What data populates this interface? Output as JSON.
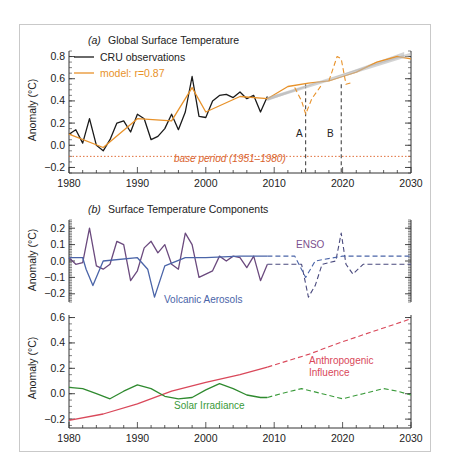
{
  "chart_data": [
    {
      "panel": "a",
      "type": "line",
      "title_prefix": "(a)",
      "title": "Global Surface Temperature",
      "xlabel": "",
      "ylabel": "Anomaly (°C)",
      "xlim": [
        1980,
        2030
      ],
      "ylim": [
        -0.25,
        0.85
      ],
      "xticks": [
        "1980",
        "1990",
        "2000",
        "2010",
        "2020",
        "2030"
      ],
      "yticks": [
        "−0.2",
        "0.0",
        "0.2",
        "0.4",
        "0.6",
        "0.8"
      ],
      "legend": [
        {
          "label": "CRU observations",
          "color": "#1a1a1a"
        },
        {
          "label": "model: r=0.87",
          "color": "#e8922a"
        }
      ],
      "annotations": [
        {
          "text": "A",
          "x": 2014.6
        },
        {
          "text": "B",
          "x": 2019.8
        },
        {
          "text": "base period (1951–1980)",
          "y": -0.1,
          "color": "#d9622b"
        }
      ],
      "series": [
        {
          "name": "CRU observations",
          "color": "#1a1a1a",
          "x": [
            1980,
            1981,
            1982,
            1983,
            1984,
            1985,
            1986,
            1987,
            1988,
            1989,
            1990,
            1991,
            1992,
            1993,
            1994,
            1995,
            1996,
            1997,
            1998,
            1999,
            2000,
            2001,
            2002,
            2003,
            2004,
            2005,
            2006,
            2007,
            2008,
            2009
          ],
          "y": [
            0.1,
            0.14,
            0.02,
            0.24,
            0.0,
            -0.05,
            0.05,
            0.2,
            0.22,
            0.12,
            0.28,
            0.24,
            0.05,
            0.08,
            0.15,
            0.28,
            0.14,
            0.3,
            0.62,
            0.26,
            0.25,
            0.4,
            0.45,
            0.46,
            0.43,
            0.48,
            0.42,
            0.45,
            0.3,
            0.44
          ]
        },
        {
          "name": "model: r=0.87",
          "color": "#e8922a",
          "x": [
            1980,
            1985,
            1990,
            1995,
            1998,
            2000,
            2005,
            2009,
            2012,
            2015,
            2018,
            2020,
            2022,
            2025,
            2028,
            2030
          ],
          "y": [
            0.1,
            -0.02,
            0.24,
            0.22,
            0.52,
            0.3,
            0.44,
            0.42,
            0.53,
            0.56,
            0.58,
            0.62,
            0.66,
            0.75,
            0.8,
            0.78
          ]
        },
        {
          "name": "model projection (shaded trend)",
          "color": "#b8b8b8",
          "x": [
            2009,
            2030
          ],
          "y": [
            0.42,
            0.82
          ]
        },
        {
          "name": "scenario A",
          "style": "dashed",
          "color": "#e8922a",
          "x": [
            2013,
            2014,
            2014.6,
            2015.5,
            2017
          ],
          "y": [
            0.52,
            0.4,
            0.28,
            0.42,
            0.55
          ]
        },
        {
          "name": "scenario B",
          "style": "dashed",
          "color": "#e8922a",
          "x": [
            2018,
            2019.2,
            2019.8,
            2020.5,
            2021.5
          ],
          "y": [
            0.58,
            0.8,
            0.78,
            0.55,
            0.57
          ]
        }
      ]
    },
    {
      "panel": "b-upper",
      "type": "line",
      "title_prefix": "(b)",
      "title": "Surface Temperature Components",
      "ylabel": "Anomaly (°C)",
      "xlim": [
        1980,
        2030
      ],
      "ylim": [
        -0.25,
        0.25
      ],
      "yticks": [
        "−0.2",
        "−0.1",
        "0.0",
        "0.1",
        "0.2"
      ],
      "labels": [
        {
          "text": "ENSO",
          "color": "#7b4f8e"
        },
        {
          "text": "Volcanic Aerosols",
          "color": "#4a64a8"
        }
      ],
      "series": [
        {
          "name": "ENSO",
          "color": "#6b4a7e",
          "x": [
            1980,
            1981,
            1982,
            1983,
            1984,
            1985,
            1986,
            1987,
            1988,
            1989,
            1990,
            1991,
            1992,
            1993,
            1994,
            1995,
            1996,
            1997,
            1998,
            1999,
            2000,
            2001,
            2002,
            2003,
            2004,
            2005,
            2006,
            2007,
            2008,
            2009
          ],
          "y": [
            0.02,
            -0.02,
            -0.01,
            0.2,
            -0.03,
            -0.05,
            -0.02,
            0.12,
            0.1,
            -0.12,
            -0.06,
            0.08,
            0.12,
            0.05,
            0.1,
            -0.02,
            -0.05,
            0.17,
            0.1,
            -0.1,
            -0.08,
            -0.06,
            0.03,
            0.0,
            0.03,
            0.02,
            -0.04,
            0.03,
            -0.12,
            -0.02
          ]
        },
        {
          "name": "ENSO (projection)",
          "color": "#4a4a7e",
          "style": "dashed",
          "x": [
            2009,
            2014,
            2015,
            2016,
            2017,
            2019,
            2019.8,
            2020.5,
            2021.5,
            2023,
            2030
          ],
          "y": [
            -0.02,
            -0.02,
            -0.22,
            -0.15,
            -0.02,
            0.0,
            0.17,
            -0.02,
            -0.08,
            -0.02,
            -0.02
          ]
        },
        {
          "name": "Volcanic Aerosols",
          "color": "#4a64a8",
          "x": [
            1980,
            1982,
            1982.5,
            1983.5,
            1985,
            1990,
            1991.5,
            1992.5,
            1994,
            1997,
            2000,
            2005,
            2009
          ],
          "y": [
            0.02,
            0.02,
            -0.05,
            -0.15,
            0.0,
            0.02,
            -0.05,
            -0.22,
            -0.03,
            0.02,
            0.02,
            0.03,
            0.03
          ]
        },
        {
          "name": "Volcanic Aerosols (projection)",
          "color": "#4a64a8",
          "style": "dashed",
          "x": [
            2009,
            2013,
            2014.6,
            2016,
            2020,
            2030
          ],
          "y": [
            0.03,
            0.03,
            -0.1,
            0.0,
            0.03,
            0.03
          ]
        }
      ]
    },
    {
      "panel": "b-lower",
      "type": "line",
      "ylabel": "Anomaly (°C)",
      "xlim": [
        1980,
        2030
      ],
      "ylim": [
        -0.25,
        0.62
      ],
      "xticks": [
        "1980",
        "1990",
        "2000",
        "2010",
        "2020",
        "2030"
      ],
      "yticks": [
        "−0.2",
        "0.0",
        "0.2",
        "0.4",
        "0.6"
      ],
      "labels": [
        {
          "text": "Anthropogenic",
          "color": "#d9485a"
        },
        {
          "text": "Influence",
          "color": "#d9485a"
        },
        {
          "text": "Solar Irradiance",
          "color": "#3a9a3a"
        }
      ],
      "series": [
        {
          "name": "Anthropogenic Influence",
          "color": "#d9485a",
          "x": [
            1980,
            1985,
            1990,
            1995,
            2000,
            2005,
            2009
          ],
          "y": [
            -0.21,
            -0.16,
            -0.08,
            0.02,
            0.09,
            0.15,
            0.21
          ]
        },
        {
          "name": "Anthropogenic Influence (projection)",
          "color": "#d9485a",
          "style": "dashed",
          "x": [
            2009,
            2015,
            2020,
            2025,
            2030
          ],
          "y": [
            0.21,
            0.31,
            0.41,
            0.5,
            0.59
          ]
        },
        {
          "name": "Solar Irradiance",
          "color": "#2f8a2f",
          "x": [
            1980,
            1982,
            1984,
            1986,
            1988,
            1990,
            1992,
            1994,
            1996,
            1998,
            2000,
            2002,
            2004,
            2006,
            2008,
            2009
          ],
          "y": [
            0.05,
            0.04,
            0.0,
            -0.04,
            0.02,
            0.07,
            0.04,
            -0.02,
            -0.04,
            -0.03,
            0.03,
            0.08,
            0.04,
            -0.01,
            -0.03,
            -0.03
          ]
        },
        {
          "name": "Solar Irradiance (projection)",
          "color": "#3a9a3a",
          "style": "dashed",
          "x": [
            2009,
            2011,
            2014,
            2017,
            2020,
            2023,
            2026,
            2028,
            2030
          ],
          "y": [
            -0.03,
            0.0,
            0.04,
            0.0,
            -0.04,
            0.0,
            0.04,
            0.02,
            -0.01
          ]
        }
      ]
    }
  ]
}
